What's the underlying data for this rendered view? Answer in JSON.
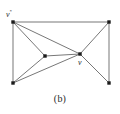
{
  "figure": {
    "caption": "(b)",
    "background_color": "#ffffff",
    "edge_color": "#5f5f5f",
    "vertex_color": "#1b1b1b",
    "label_color": "#2a2a2a",
    "width": 120,
    "height": 114
  },
  "chart_data": {
    "type": "diagram",
    "title": "(b)",
    "subtitle": "",
    "xlabel": "",
    "ylabel": "",
    "graph_kind": "undirected planar graph drawing",
    "vertex_count": 6,
    "edge_count": 10,
    "nodes": [
      {
        "id": "v_star",
        "label": "v",
        "superscript": "*",
        "x": 13,
        "y": 22,
        "label_dx": -7,
        "label_dy": -13
      },
      {
        "id": "tr",
        "label": "",
        "superscript": "",
        "x": 109,
        "y": 22,
        "label_dx": 0,
        "label_dy": 0
      },
      {
        "id": "bl",
        "label": "",
        "superscript": "",
        "x": 13,
        "y": 83,
        "label_dx": 0,
        "label_dy": 0
      },
      {
        "id": "br",
        "label": "",
        "superscript": "",
        "x": 109,
        "y": 83,
        "label_dx": 0,
        "label_dy": 0
      },
      {
        "id": "ml",
        "label": "",
        "superscript": "",
        "x": 45,
        "y": 56,
        "label_dx": 0,
        "label_dy": 0
      },
      {
        "id": "v",
        "label": "v",
        "superscript": "",
        "x": 80,
        "y": 54,
        "label_dx": -2,
        "label_dy": 7
      }
    ],
    "edges": [
      {
        "from": "v_star",
        "to": "tr"
      },
      {
        "from": "v_star",
        "to": "bl"
      },
      {
        "from": "v_star",
        "to": "ml"
      },
      {
        "from": "v_star",
        "to": "v"
      },
      {
        "from": "bl",
        "to": "ml"
      },
      {
        "from": "bl",
        "to": "v"
      },
      {
        "from": "ml",
        "to": "v"
      },
      {
        "from": "v",
        "to": "tr"
      },
      {
        "from": "v",
        "to": "br"
      },
      {
        "from": "tr",
        "to": "br"
      }
    ],
    "annotations": [
      {
        "text": "v*",
        "x": 6,
        "y": 9
      },
      {
        "text": "v",
        "x": 78,
        "y": 59
      },
      {
        "text": "(b)",
        "x": 60,
        "y": 98
      }
    ],
    "grid": false,
    "legend_position": "none"
  },
  "labels": {
    "v_star_base": "v",
    "v_star_sup": "*",
    "v_base": "v"
  }
}
